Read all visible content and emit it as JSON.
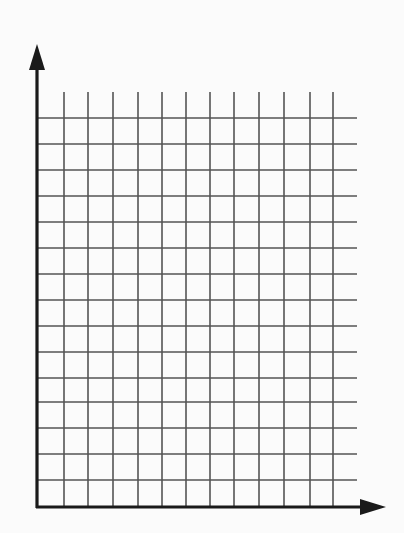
{
  "diagram": {
    "type": "blank coordinate grid",
    "colors": {
      "background": "#fbfbfb",
      "grid_line": "#555555",
      "axis": "#1a1a1a"
    },
    "axes": {
      "y_axis": {
        "x": 37,
        "y_top": 44,
        "y_bottom": 508,
        "arrow": "up"
      },
      "x_axis": {
        "y": 507,
        "x_left": 36,
        "x_right": 386,
        "arrow": "right"
      }
    },
    "grid": {
      "vertical_lines_x": [
        64,
        88,
        113,
        138,
        162,
        186,
        210,
        234,
        259,
        284,
        310,
        333
      ],
      "vertical_top": 92,
      "horizontal_lines_y": [
        118,
        144,
        170,
        196,
        222,
        248,
        274,
        300,
        326,
        352,
        378,
        402,
        428,
        454,
        480
      ],
      "horizontal_left": 37,
      "horizontal_right": 357
    }
  }
}
